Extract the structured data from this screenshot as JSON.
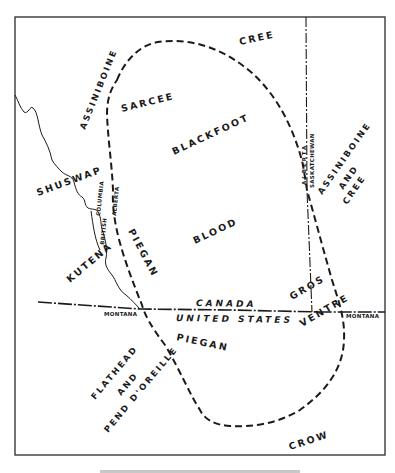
{
  "map": {
    "title": "Blackfoot territory and neighboring tribes",
    "tribes": [
      {
        "id": "cree-north",
        "label": "CREE"
      },
      {
        "id": "assiniboine-west",
        "label": "ASSINIBOINE"
      },
      {
        "id": "sarcee",
        "label": "SARCEE"
      },
      {
        "id": "blackfoot",
        "label": "BLACKFOOT"
      },
      {
        "id": "shuswap",
        "label": "SHUSWAP"
      },
      {
        "id": "blood",
        "label": "BLOOD"
      },
      {
        "id": "piegan-north",
        "label": "PIEGAN"
      },
      {
        "id": "kutenai",
        "label": "KUTENA"
      },
      {
        "id": "assiniboine-and-cree",
        "line1": "ASSINIBOINE",
        "line2": "AND",
        "line3": "CREE"
      },
      {
        "id": "gros-ventre",
        "line1": "GROS",
        "line2": "VENTRE"
      },
      {
        "id": "piegan-south",
        "label": "PIEGAN"
      },
      {
        "id": "flathead-pend-oreille",
        "line1": "FLATHEAD",
        "line2": "AND",
        "line3": "PEND D'OREILLE"
      },
      {
        "id": "crow",
        "label": "CROW"
      }
    ],
    "political": {
      "country_north": "CANADA",
      "country_south": "UNITED STATES",
      "province_west": "BRITISH COLUMBIA",
      "province_alberta_west": "ALBERTA",
      "province_alberta_east": "ALBERTA",
      "province_east": "SASKATCHEWAN",
      "state_west": "MONTANA",
      "state_east": "MONTANA"
    }
  }
}
